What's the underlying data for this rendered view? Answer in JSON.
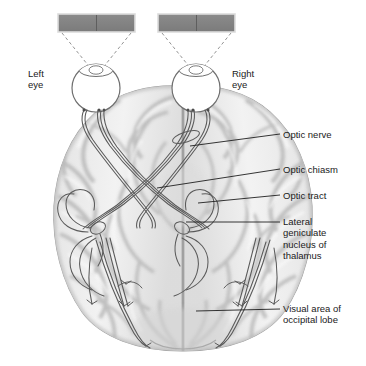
{
  "figure": {
    "title_text": "",
    "eye_labels": [
      {
        "name": "left-eye",
        "text": "Left\neye"
      },
      {
        "name": "right-eye",
        "text": "Right\neye"
      }
    ],
    "callouts": [
      {
        "name": "optic-nerve",
        "text": "Optic nerve"
      },
      {
        "name": "optic-chiasm",
        "text": "Optic chiasm"
      },
      {
        "name": "optic-tract",
        "text": "Optic tract"
      },
      {
        "name": "lateral-geniculate-nucleus",
        "text": "Lateral\ngeniculate\nnucleus of\nthalamus"
      },
      {
        "name": "visual-area-occipital-lobe",
        "text": "Visual area of\noccipital lobe"
      }
    ],
    "visual_field_bars": [
      {
        "name": "left-visual-field-bar",
        "halves": 2
      },
      {
        "name": "right-visual-field-bar",
        "halves": 2
      }
    ],
    "colors": {
      "background": "#ffffff",
      "bar_fill": "#808080",
      "bar_stroke": "#d8d8d8",
      "brain_light": "#f2f2f2",
      "brain_mid": "#dedede",
      "brain_shadow": "#b9b9b9",
      "outline": "#6b6b6b",
      "nerve_stroke": "#555555",
      "ray_dash": "#777777",
      "leader_line": "#222222",
      "text": "#1a1a1a"
    }
  }
}
